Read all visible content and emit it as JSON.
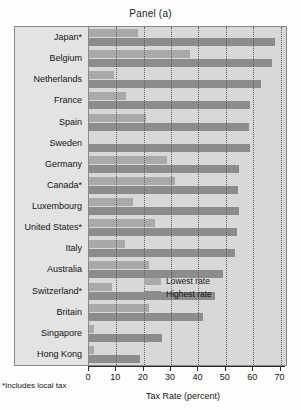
{
  "title": "Panel (a)",
  "footnote": "*Includes local tax",
  "axis": {
    "xlabel": "Tax Rate (percent)",
    "ticks": [
      "0",
      "10",
      "20",
      "30",
      "40",
      "50",
      "60",
      "70"
    ]
  },
  "legend": {
    "low_label": "Lowest rate",
    "high_label": "Highest rate",
    "low_color": "#a9a9a9",
    "high_color": "#8c8c8c"
  },
  "chart_data": {
    "type": "bar",
    "orientation": "horizontal",
    "title": "Panel (a)",
    "xlabel": "Tax Rate (percent)",
    "ylabel": "",
    "xlim": [
      0,
      72
    ],
    "grid": true,
    "legend_position": "inside-bottom-right",
    "categories": [
      "Japan*",
      "Belgium",
      "Netherlands",
      "France",
      "Spain",
      "Sweden",
      "Germany",
      "Canada*",
      "Luxembourg",
      "United States*",
      "Italy",
      "Australia",
      "Switzerland*",
      "Britain",
      "Singapore",
      "Hong Kong"
    ],
    "series": [
      {
        "name": "Lowest rate",
        "color": "#a9a9a9",
        "values": [
          18,
          37,
          9,
          13.5,
          21,
          0,
          28.5,
          31.5,
          16,
          24,
          13,
          22,
          8.5,
          22,
          2,
          2
        ]
      },
      {
        "name": "Highest rate",
        "color": "#8c8c8c",
        "values": [
          68,
          67,
          63,
          59,
          58.5,
          59,
          55,
          54.5,
          55,
          54,
          53.5,
          49,
          46,
          41.5,
          26.5,
          18.5
        ]
      }
    ]
  }
}
